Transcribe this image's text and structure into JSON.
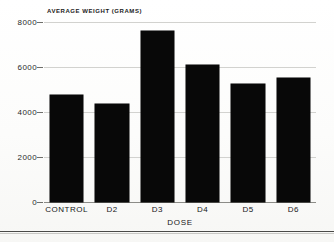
{
  "figure": {
    "background_color": "#fdfdfc",
    "bar_color": "#080808",
    "gridline_color": "#d2d2cf",
    "axis_color": "#8c8c88"
  },
  "chart_data": {
    "type": "bar",
    "title": "",
    "xlabel": "DOSE",
    "ylabel": "AVERAGE WEIGHT (GRAMS)",
    "categories": [
      "CONTROL",
      "D2",
      "D3",
      "D4",
      "D5",
      "D6"
    ],
    "values": [
      4750,
      4350,
      7600,
      6100,
      5250,
      5500
    ],
    "ylim": [
      0,
      8000
    ],
    "yticks": [
      0,
      2000,
      4000,
      6000,
      8000
    ],
    "ytick_labels": [
      "0",
      "2000",
      "4000",
      "6000",
      "8000"
    ],
    "grid": true,
    "legend": null,
    "legend_position": "none"
  }
}
